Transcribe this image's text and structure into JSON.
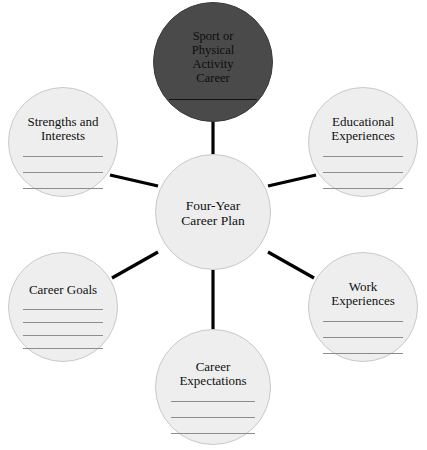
{
  "diagram": {
    "type": "radial-concept-map",
    "title_node": "Sport or Physical Activity Career",
    "hub_label": "Four-Year\nCareer Plan",
    "colors": {
      "page_background": "#ffffff",
      "satellite_fill": "#eeeeee",
      "satellite_stroke": "#c9c9c9",
      "dark_node_fill": "#4a4a4a",
      "spoke": "#000000",
      "write_line": "#8d8d8d",
      "text": "#111111"
    },
    "nodes": [
      {
        "id": "sport-career",
        "label": "Sport or\nPhysical\nActivity\nCareer",
        "style": "dark",
        "blank_lines": 1,
        "cx": 213,
        "cy": 62,
        "r": 60,
        "line_width": 88
      },
      {
        "id": "hub",
        "label": "Four-Year\nCareer Plan",
        "style": "hub",
        "blank_lines": 0,
        "cx": 213,
        "cy": 212,
        "r": 58,
        "line_width": 0
      },
      {
        "id": "strengths-interests",
        "label": "Strengths and\nInterests",
        "style": "satellite",
        "blank_lines": 3,
        "cx": 63,
        "cy": 142,
        "r": 55,
        "line_width": 80
      },
      {
        "id": "educational-experiences",
        "label": "Educational\nExperiences",
        "style": "satellite",
        "blank_lines": 3,
        "cx": 363,
        "cy": 142,
        "r": 55,
        "line_width": 80
      },
      {
        "id": "career-goals",
        "label": "Career Goals",
        "style": "satellite",
        "blank_lines": 4,
        "cx": 63,
        "cy": 307,
        "r": 55,
        "line_width": 80
      },
      {
        "id": "work-experiences",
        "label": "Work\nExperiences",
        "style": "satellite",
        "blank_lines": 3,
        "cx": 363,
        "cy": 307,
        "r": 55,
        "line_width": 80
      },
      {
        "id": "career-expectations",
        "label": "Career\nExpectations",
        "style": "satellite",
        "blank_lines": 3,
        "cx": 213,
        "cy": 387,
        "r": 58,
        "line_width": 84
      }
    ],
    "connections": [
      {
        "id": "hub-to-sport-career",
        "from": "hub",
        "to": "sport-career",
        "x1": 213,
        "y1": 154,
        "x2": 213,
        "y2": 118
      },
      {
        "id": "hub-to-strengths",
        "from": "hub",
        "to": "strengths-interests",
        "x1": 158,
        "y1": 186,
        "x2": 110,
        "y2": 175
      },
      {
        "id": "hub-to-educational",
        "from": "hub",
        "to": "educational-experiences",
        "x1": 268,
        "y1": 186,
        "x2": 316,
        "y2": 175
      },
      {
        "id": "hub-to-career-goals",
        "from": "hub",
        "to": "career-goals",
        "x1": 158,
        "y1": 252,
        "x2": 112,
        "y2": 278
      },
      {
        "id": "hub-to-work",
        "from": "hub",
        "to": "work-experiences",
        "x1": 268,
        "y1": 252,
        "x2": 314,
        "y2": 278
      },
      {
        "id": "hub-to-expectations",
        "from": "hub",
        "to": "career-expectations",
        "x1": 213,
        "y1": 270,
        "x2": 213,
        "y2": 330
      }
    ]
  }
}
